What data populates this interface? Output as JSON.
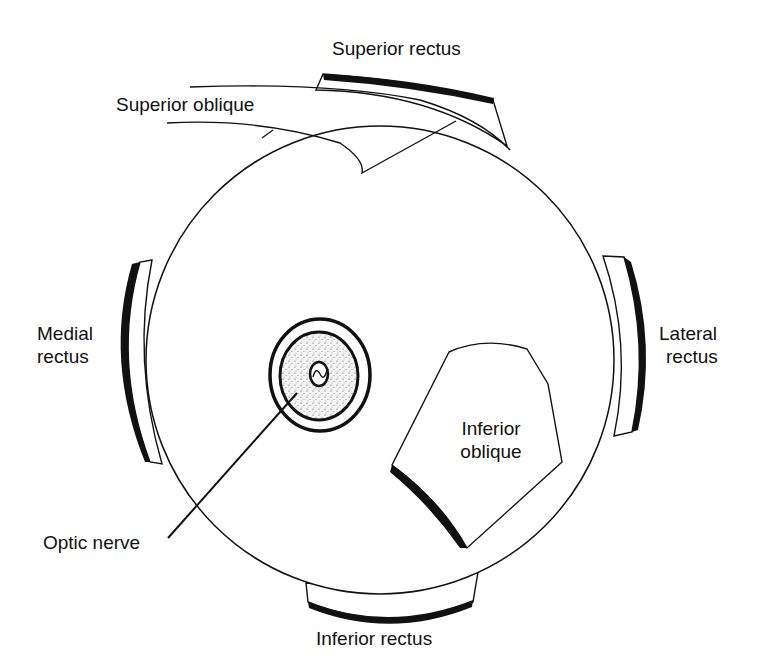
{
  "diagram": {
    "type": "anatomical",
    "colors": {
      "line": "#111111",
      "muscle_fill": "#ffffff",
      "tendon_band": "#111111",
      "optic_nerve_fill": "#e8e8e8",
      "background": "#ffffff"
    }
  },
  "labels": {
    "superior_rectus": "Superior rectus",
    "superior_oblique": "Superior oblique",
    "medial_rectus_line1": "Medial",
    "medial_rectus_line2": "rectus",
    "lateral_rectus_line1": "Lateral",
    "lateral_rectus_line2": "rectus",
    "inferior_oblique_line1": "Inferior",
    "inferior_oblique_line2": "oblique",
    "optic_nerve": "Optic nerve",
    "inferior_rectus": "Inferior rectus"
  },
  "structures": [
    {
      "name": "eyeball",
      "shape": "circle"
    },
    {
      "name": "superior-rectus",
      "position": "top"
    },
    {
      "name": "superior-oblique",
      "position": "top-left"
    },
    {
      "name": "medial-rectus",
      "position": "left"
    },
    {
      "name": "lateral-rectus",
      "position": "right"
    },
    {
      "name": "inferior-rectus",
      "position": "bottom"
    },
    {
      "name": "inferior-oblique",
      "position": "lower-right"
    },
    {
      "name": "optic-nerve",
      "position": "center-left"
    }
  ]
}
